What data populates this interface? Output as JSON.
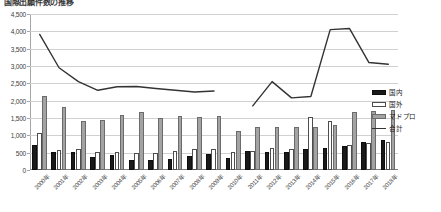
{
  "title": "国際出願件数の推移",
  "legend": {
    "position": "right",
    "items": [
      {
        "name": "kokunai",
        "label": "国内",
        "color": "#1a1a1a",
        "marker": "bar"
      },
      {
        "name": "kokugai",
        "label": "国外",
        "color": "#ffffff",
        "marker": "bar"
      },
      {
        "name": "madopro",
        "label": "マドプロ",
        "color": "#a3a3a3",
        "marker": "bar"
      },
      {
        "name": "goukei",
        "label": "合計",
        "color": "#333333",
        "marker": "line"
      }
    ]
  },
  "chart_data": {
    "type": "bar",
    "title": "国際出願件数の推移",
    "xlabel": "",
    "ylabel": "",
    "ylim": [
      0,
      4500
    ],
    "ytick_step": 500,
    "yticks": [
      0,
      500,
      1000,
      1500,
      2000,
      2500,
      3000,
      3500,
      4000,
      4500
    ],
    "ytick_labels": [
      "0",
      "500",
      "1,000",
      "1,500",
      "2,000",
      "2,500",
      "3,000",
      "3,500",
      "4,000",
      "4,500"
    ],
    "grid": true,
    "categories": [
      "2000年",
      "2001年",
      "2002年",
      "2003年",
      "2004年",
      "2005年",
      "2006年",
      "2007年",
      "2008年",
      "2009年",
      "2010年",
      "2011年",
      "2012年",
      "2013年",
      "2014年",
      "2015年",
      "2016年",
      "2017年",
      "2018年"
    ],
    "series": [
      {
        "name": "国内",
        "type": "bar",
        "color": "#1a1a1a",
        "values": [
          720,
          520,
          510,
          380,
          420,
          300,
          300,
          330,
          400,
          450,
          340,
          560,
          530,
          520,
          600,
          640,
          700,
          820,
          880
        ]
      },
      {
        "name": "国外",
        "type": "bar",
        "color": "#ffffff",
        "values": [
          1060,
          570,
          620,
          510,
          510,
          500,
          500,
          560,
          600,
          620,
          530,
          560,
          640,
          610,
          1530,
          1420,
          730,
          790,
          820
        ]
      },
      {
        "name": "マドプロ",
        "type": "bar",
        "color": "#a3a3a3",
        "values": [
          2130,
          1820,
          1400,
          1440,
          1590,
          1660,
          1500,
          1560,
          1520,
          1550,
          1120,
          1250,
          1250,
          1230,
          1240,
          1300,
          1660,
          1700,
          1740
        ]
      },
      {
        "name": "合計",
        "type": "line",
        "color": "#333333",
        "values": [
          3910,
          2950,
          2550,
          2300,
          2400,
          2410,
          2350,
          2300,
          2250,
          2280,
          1990,
          1850,
          2550,
          2080,
          2120,
          4050,
          4080,
          3100,
          3050
        ]
      }
    ]
  }
}
